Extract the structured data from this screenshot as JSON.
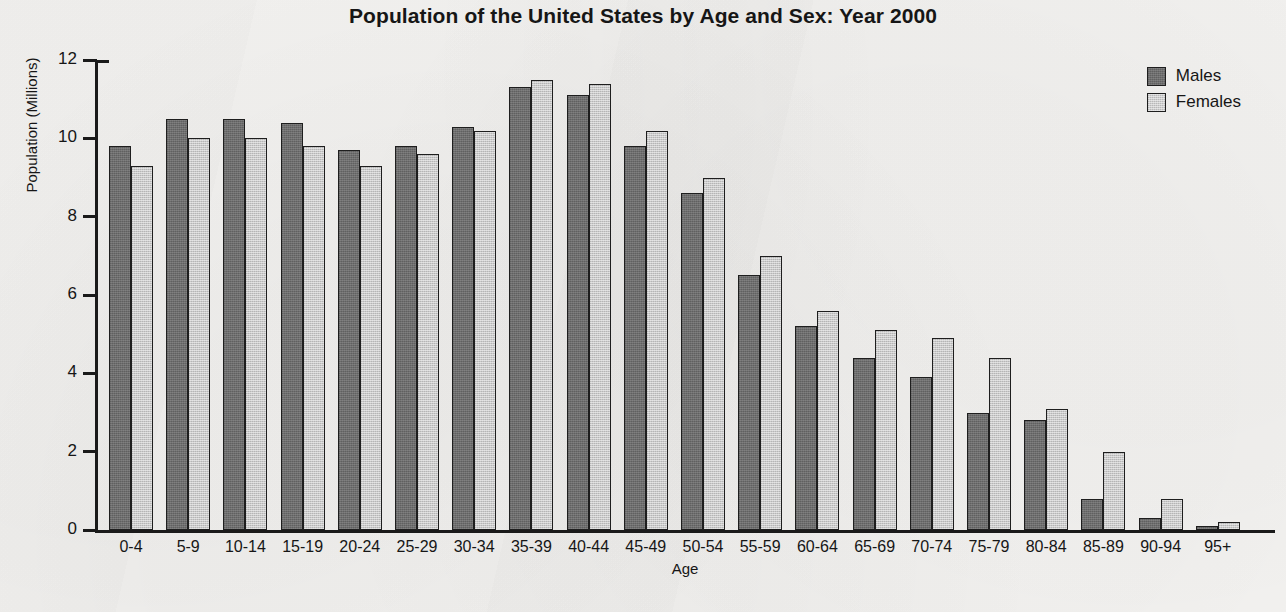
{
  "chart_data": {
    "type": "bar",
    "title": "Population of the United States by Age and Sex: Year 2000",
    "xlabel": "Age",
    "ylabel": "Population (Millions)",
    "ylim": [
      0,
      12
    ],
    "ytick_labels": [
      "12",
      "10",
      "8",
      "6",
      "4",
      "2",
      "0"
    ],
    "ytick_values": [
      12,
      10,
      8,
      6,
      4,
      2,
      0
    ],
    "grid": false,
    "legend_position": "top-right",
    "categories": [
      "0-4",
      "5-9",
      "10-14",
      "15-19",
      "20-24",
      "25-29",
      "30-34",
      "35-39",
      "40-44",
      "45-49",
      "50-54",
      "55-59",
      "60-64",
      "65-69",
      "70-74",
      "75-79",
      "80-84",
      "85-89",
      "90-94",
      "95+"
    ],
    "series": [
      {
        "name": "Males",
        "color": "#6d6d6d",
        "values": [
          9.8,
          10.5,
          10.5,
          10.4,
          9.7,
          9.8,
          10.3,
          11.3,
          11.1,
          9.8,
          8.6,
          6.5,
          5.2,
          4.4,
          3.9,
          3.0,
          2.8,
          0.8,
          0.3,
          0.1
        ]
      },
      {
        "name": "Females",
        "color": "#c9c9c9",
        "values": [
          9.3,
          10.0,
          10.0,
          9.8,
          9.3,
          9.6,
          10.2,
          11.5,
          11.4,
          10.2,
          9.0,
          7.0,
          5.6,
          5.1,
          4.9,
          4.4,
          3.1,
          2.0,
          0.8,
          0.2
        ]
      }
    ]
  },
  "legend": {
    "items": [
      {
        "label": "Males"
      },
      {
        "label": "Females"
      }
    ]
  }
}
